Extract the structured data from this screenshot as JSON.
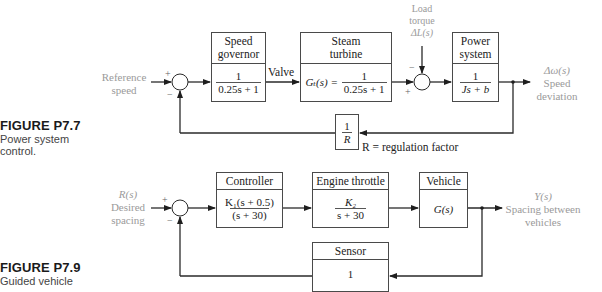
{
  "figures": [
    {
      "id": "P7.7",
      "title": "FIGURE P7.7",
      "caption_lines": [
        "Power system",
        "control."
      ],
      "input_label_lines": [
        "Reference",
        "speed"
      ],
      "sum1_signs": {
        "plus": "+",
        "minus": "−"
      },
      "blocks": [
        {
          "name": "speed-governor",
          "header_lines": [
            "Speed",
            "governor"
          ],
          "numerator": "1",
          "denominator": "0.25s + 1"
        },
        {
          "name": "steam-turbine",
          "header_lines": [
            "Steam",
            "turbine"
          ],
          "prefix": "Gₜ(s) =",
          "numerator": "1",
          "denominator": "0.25s + 1"
        },
        {
          "name": "power-system",
          "header_lines": [
            "Power",
            "system"
          ],
          "numerator": "1",
          "denominator": "Js + b"
        }
      ],
      "valve_label": "Valve",
      "disturbance_label_lines": [
        "Load",
        "torque",
        "ΔL(s)"
      ],
      "sum2_signs": {
        "plus": "+",
        "minus": "−"
      },
      "output_label_lines": [
        "Δω(s)",
        "Speed",
        "deviation"
      ],
      "feedback_block": {
        "numerator": "1",
        "denominator": "R"
      },
      "feedback_note": "R = regulation factor"
    },
    {
      "id": "P7.9",
      "title": "FIGURE P7.9",
      "caption_lines": [
        "Guided vehicle"
      ],
      "input_label_lines": [
        "R(s)",
        "Desired",
        "spacing"
      ],
      "sum1_signs": {
        "plus": "+",
        "minus": "−"
      },
      "blocks": [
        {
          "name": "controller",
          "header": "Controller",
          "numerator": "K₁(s + 0.5)",
          "denominator": "(s + 30)"
        },
        {
          "name": "engine-throttle",
          "header": "Engine throttle",
          "numerator": "K₂",
          "denominator": "s + 30"
        },
        {
          "name": "vehicle",
          "header": "Vehicle",
          "body": "G(s)"
        }
      ],
      "output_label_lines": [
        "Y(s)",
        "Spacing between",
        "vehicles"
      ],
      "sensor_block": {
        "header": "Sensor",
        "body": "1"
      }
    }
  ],
  "colors": {
    "line": "#2a2a2a",
    "label_gray": "#9a9a9a",
    "box_border": "#4a4a4a"
  }
}
